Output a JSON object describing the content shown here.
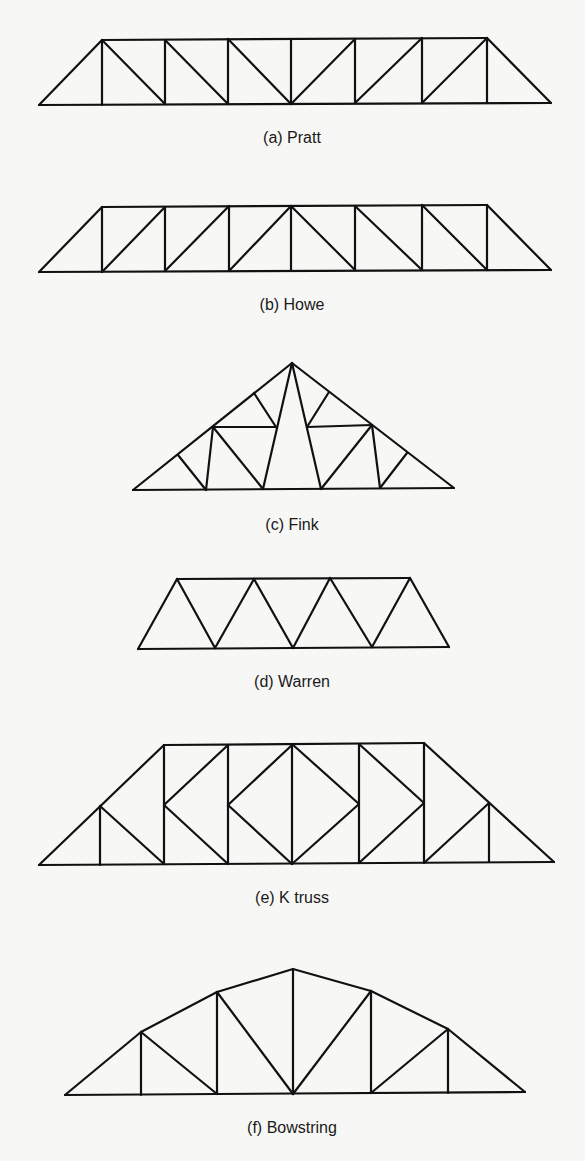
{
  "colors": {
    "background": "#f7f7f5",
    "line": "#111111",
    "text": "#1a1a1a"
  },
  "trusses": [
    {
      "id": "pratt",
      "label": "(a) Pratt",
      "label_pos": [
        292,
        143
      ],
      "members": [
        [
          39,
          105,
          551,
          103
        ],
        [
          102,
          40,
          487,
          38
        ],
        [
          39,
          105,
          102,
          40
        ],
        [
          487,
          38,
          551,
          103
        ],
        [
          102,
          40,
          102,
          105
        ],
        [
          165,
          40,
          165,
          104
        ],
        [
          228,
          39,
          228,
          104
        ],
        [
          291,
          39,
          291,
          104
        ],
        [
          355,
          39,
          355,
          103
        ],
        [
          422,
          38,
          422,
          103
        ],
        [
          487,
          38,
          487,
          103
        ],
        [
          102,
          40,
          165,
          104
        ],
        [
          165,
          40,
          228,
          104
        ],
        [
          228,
          39,
          291,
          104
        ],
        [
          291,
          104,
          355,
          39
        ],
        [
          355,
          103,
          422,
          38
        ],
        [
          422,
          103,
          487,
          38
        ]
      ]
    },
    {
      "id": "howe",
      "label": "(b) Howe",
      "label_pos": [
        292,
        310
      ],
      "members": [
        [
          39,
          272,
          551,
          270
        ],
        [
          102,
          207,
          487,
          205
        ],
        [
          39,
          272,
          102,
          207
        ],
        [
          487,
          205,
          551,
          270
        ],
        [
          102,
          207,
          102,
          272
        ],
        [
          165,
          207,
          165,
          271
        ],
        [
          229,
          206,
          229,
          271
        ],
        [
          291,
          206,
          291,
          271
        ],
        [
          355,
          206,
          355,
          270
        ],
        [
          422,
          205,
          422,
          270
        ],
        [
          487,
          205,
          487,
          270
        ],
        [
          102,
          272,
          165,
          207
        ],
        [
          165,
          271,
          229,
          206
        ],
        [
          229,
          271,
          291,
          206
        ],
        [
          291,
          206,
          355,
          270
        ],
        [
          355,
          206,
          422,
          270
        ],
        [
          422,
          205,
          487,
          270
        ]
      ]
    },
    {
      "id": "fink",
      "label": "(c) Fink",
      "label_pos": [
        292,
        530
      ],
      "members": [
        [
          133,
          490,
          454,
          488
        ],
        [
          133,
          490,
          292,
          363
        ],
        [
          292,
          363,
          454,
          488
        ],
        [
          213,
          427,
          276,
          427
        ],
        [
          307,
          427,
          372,
          425
        ],
        [
          292,
          363,
          263,
          489
        ],
        [
          292,
          363,
          321,
          489
        ],
        [
          254,
          393,
          276,
          427
        ],
        [
          329,
          392,
          307,
          427
        ],
        [
          213,
          427,
          206,
          490
        ],
        [
          213,
          427,
          263,
          489
        ],
        [
          178,
          455,
          206,
          490
        ],
        [
          372,
          425,
          380,
          488
        ],
        [
          372,
          425,
          321,
          489
        ],
        [
          407,
          453,
          380,
          488
        ]
      ]
    },
    {
      "id": "warren",
      "label": "(d) Warren",
      "label_pos": [
        292,
        687
      ],
      "members": [
        [
          138,
          649,
          449,
          647
        ],
        [
          177,
          579,
          410,
          578
        ],
        [
          138,
          649,
          177,
          579
        ],
        [
          177,
          579,
          215,
          648
        ],
        [
          215,
          648,
          254,
          579
        ],
        [
          254,
          579,
          293,
          648
        ],
        [
          293,
          648,
          330,
          578
        ],
        [
          330,
          578,
          372,
          647
        ],
        [
          372,
          647,
          410,
          578
        ],
        [
          410,
          578,
          449,
          647
        ]
      ]
    },
    {
      "id": "k-truss",
      "label": "(e) K truss",
      "label_pos": [
        292,
        903
      ],
      "members": [
        [
          39,
          865,
          554,
          862
        ],
        [
          164,
          745,
          424,
          743
        ],
        [
          39,
          865,
          164,
          745
        ],
        [
          424,
          743,
          554,
          862
        ],
        [
          100,
          806,
          100,
          865
        ],
        [
          100,
          806,
          164,
          864
        ],
        [
          164,
          745,
          164,
          864
        ],
        [
          164,
          805,
          228,
          745
        ],
        [
          164,
          805,
          228,
          864
        ],
        [
          228,
          745,
          228,
          864
        ],
        [
          228,
          805,
          292,
          745
        ],
        [
          228,
          805,
          292,
          864
        ],
        [
          292,
          744,
          292,
          864
        ],
        [
          292,
          744,
          359,
          804
        ],
        [
          292,
          864,
          359,
          804
        ],
        [
          359,
          744,
          359,
          863
        ],
        [
          359,
          744,
          424,
          803
        ],
        [
          359,
          863,
          424,
          803
        ],
        [
          424,
          743,
          424,
          863
        ],
        [
          424,
          863,
          489,
          803
        ],
        [
          489,
          803,
          489,
          862
        ]
      ]
    },
    {
      "id": "bowstring",
      "label": "(f) Bowstring",
      "label_pos": [
        292,
        1133
      ],
      "members": [
        [
          65,
          1095,
          525,
          1092
        ],
        [
          65,
          1095,
          141,
          1032
        ],
        [
          141,
          1032,
          217,
          992
        ],
        [
          217,
          992,
          293,
          969
        ],
        [
          293,
          969,
          371,
          991
        ],
        [
          371,
          991,
          448,
          1029
        ],
        [
          448,
          1029,
          525,
          1092
        ],
        [
          141,
          1032,
          141,
          1095
        ],
        [
          141,
          1032,
          217,
          1094
        ],
        [
          217,
          992,
          217,
          1094
        ],
        [
          217,
          992,
          293,
          1094
        ],
        [
          293,
          969,
          293,
          1094
        ],
        [
          293,
          1094,
          371,
          991
        ],
        [
          371,
          991,
          371,
          1093
        ],
        [
          371,
          1093,
          448,
          1029
        ],
        [
          448,
          1029,
          448,
          1093
        ]
      ]
    }
  ]
}
